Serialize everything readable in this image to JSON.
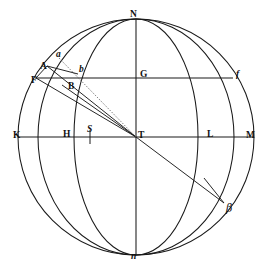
{
  "figure": {
    "background_color": "#ffffff",
    "ink_color": "#1a1a1a",
    "width": 270,
    "height": 274
  },
  "labels": [
    {
      "id": "N",
      "text": "N",
      "style": "roman",
      "x": 130,
      "y": 10,
      "role": "north-pole-label"
    },
    {
      "id": "n",
      "text": "n",
      "style": "italic",
      "x": 131,
      "y": 252,
      "role": "south-pole-label"
    },
    {
      "id": "K",
      "text": "K",
      "style": "roman",
      "x": 13,
      "y": 131,
      "role": "horizon-west-label"
    },
    {
      "id": "M",
      "text": "M",
      "style": "roman",
      "x": 246,
      "y": 131,
      "role": "horizon-east-label"
    },
    {
      "id": "T",
      "text": "T",
      "style": "roman",
      "x": 138,
      "y": 131,
      "role": "center-label"
    },
    {
      "id": "H",
      "text": "H",
      "style": "roman",
      "x": 63,
      "y": 130,
      "role": "point-h-label"
    },
    {
      "id": "L",
      "text": "L",
      "style": "roman",
      "x": 207,
      "y": 130,
      "role": "point-l-label"
    },
    {
      "id": "S",
      "text": "S",
      "style": "italic",
      "x": 87,
      "y": 125,
      "role": "point-s-label"
    },
    {
      "id": "G",
      "text": "G",
      "style": "roman",
      "x": 140,
      "y": 70,
      "role": "point-g-label"
    },
    {
      "id": "F",
      "text": "F",
      "style": "roman",
      "x": 31,
      "y": 76,
      "role": "point-f-label"
    },
    {
      "id": "f",
      "text": "f",
      "style": "italic",
      "x": 236,
      "y": 70,
      "role": "point-f-small-label"
    },
    {
      "id": "A",
      "text": "A",
      "style": "roman",
      "x": 40,
      "y": 62,
      "role": "point-a-label"
    },
    {
      "id": "B",
      "text": "B",
      "style": "roman",
      "x": 68,
      "y": 82,
      "role": "point-b-label"
    },
    {
      "id": "a",
      "text": "a",
      "style": "italic",
      "x": 56,
      "y": 50,
      "role": "point-a-small-label"
    },
    {
      "id": "b",
      "text": "b",
      "style": "italic",
      "x": 79,
      "y": 65,
      "role": "point-b-small-label"
    },
    {
      "id": "beta",
      "text": "β",
      "style": "greek",
      "x": 226,
      "y": 203,
      "role": "point-beta-label"
    }
  ],
  "geometry": {
    "center": {
      "x": 136,
      "y": 137
    },
    "outer_circle": {
      "cx": 136,
      "cy": 137,
      "r": 118
    },
    "vertical_axis": {
      "x": 136,
      "y1": 19,
      "y2": 255
    },
    "horizon_line": {
      "y": 137,
      "x1": 18,
      "x2": 254
    },
    "upper_parallel": {
      "y": 78,
      "x1": 35,
      "x2": 233
    },
    "meridian_wide": {
      "rx": 98,
      "note": "ellipse N-n through K-side, outer meridian"
    },
    "meridian_narrow": {
      "rx": 62,
      "note": "ellipse N-n, inner meridian"
    },
    "s_tick": {
      "x": 90,
      "y1": 131,
      "y2": 143
    }
  },
  "rays": [
    {
      "id": "T-F",
      "from": "T",
      "to": "F",
      "style": "solid"
    },
    {
      "id": "T-B",
      "from": "T",
      "to": "B",
      "style": "solid"
    },
    {
      "id": "T-a",
      "from": "T",
      "to": "a",
      "style": "dotted"
    },
    {
      "id": "T-beta",
      "from": "T",
      "to": "beta",
      "style": "solid"
    },
    {
      "id": "F-A",
      "from": "F",
      "to": "A",
      "style": "solid"
    },
    {
      "id": "A-b",
      "from": "A",
      "to": "b",
      "style": "solid"
    },
    {
      "id": "beta-perp",
      "from": "beta",
      "to": "meridian",
      "style": "solid"
    }
  ]
}
